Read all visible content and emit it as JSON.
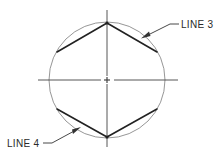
{
  "diagram": {
    "colors": {
      "circle": "#8a8a8a",
      "centerline": "#444444",
      "chord": "#222222",
      "label": "#2a2a2a",
      "background": "#ffffff"
    },
    "center": {
      "x": 107,
      "y": 80
    },
    "circle_radius": 58,
    "labels": [
      {
        "id": "line3",
        "text": "LINE 3"
      },
      {
        "id": "line4",
        "text": "LINE 4"
      }
    ]
  }
}
